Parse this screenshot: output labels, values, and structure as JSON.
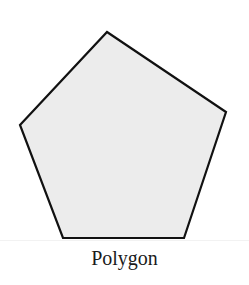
{
  "figure": {
    "caption": "Polygon",
    "shape": "pentagon",
    "fill_color": "#ececec",
    "stroke_color": "#111111",
    "points": "107,32 226,112 184,238 63,238 20,125"
  }
}
